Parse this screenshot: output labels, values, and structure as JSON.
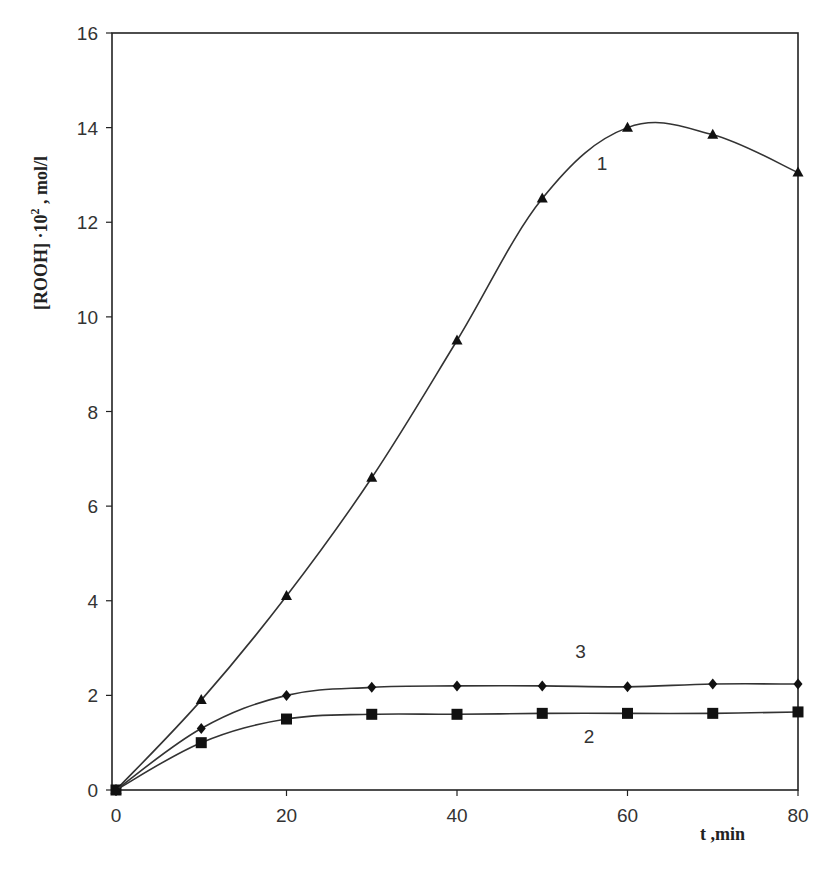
{
  "chart_data": {
    "type": "line",
    "title": "",
    "xlabel": "t ,min",
    "ylabel_main": "[ROOH] ·10",
    "ylabel_sup": "2",
    "ylabel_unit": " ,  mol/l",
    "xlim": [
      0,
      80
    ],
    "ylim": [
      0,
      16
    ],
    "xticks": [
      0,
      20,
      40,
      60,
      80
    ],
    "yticks": [
      0,
      2,
      4,
      6,
      8,
      10,
      12,
      14,
      16
    ],
    "grid": false,
    "legend": "inline curve numbers",
    "x": [
      0,
      10,
      20,
      30,
      40,
      50,
      60,
      70,
      80
    ],
    "series": [
      {
        "name": "1",
        "marker": "triangle",
        "values": [
          0,
          1.9,
          4.1,
          6.6,
          9.5,
          12.5,
          14.0,
          13.85,
          13.05
        ]
      },
      {
        "name": "2",
        "marker": "square",
        "values": [
          0,
          1.0,
          1.5,
          1.6,
          1.6,
          1.62,
          1.62,
          1.62,
          1.65
        ]
      },
      {
        "name": "3",
        "marker": "diamond",
        "values": [
          0,
          1.3,
          2.0,
          2.17,
          2.2,
          2.2,
          2.18,
          2.24,
          2.24
        ]
      }
    ],
    "annotations": [
      {
        "text": "1",
        "x": 57,
        "y": 13.1
      },
      {
        "text": "3",
        "x": 54.5,
        "y": 2.8
      },
      {
        "text": "2",
        "x": 55.5,
        "y": 1.0
      }
    ]
  },
  "colors": {
    "line": "#333333",
    "marker": "#111111",
    "axis": "#222222"
  }
}
